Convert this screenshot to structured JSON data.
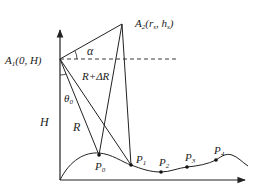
{
  "diagram": {
    "labels": {
      "A1": {
        "main": "A",
        "sub": "1",
        "rest": "(0, H)"
      },
      "A2": {
        "main": "A",
        "sub": "2",
        "rest_open": "(r",
        "rest_sub1": "s",
        "comma": ", h",
        "rest_sub2": "s",
        "close": ")"
      },
      "alpha": "α",
      "R_plus_dR": "R+ΔR",
      "theta0": {
        "main": "θ",
        "sub": "0"
      },
      "H": "H",
      "R": "R",
      "P0": {
        "main": "P",
        "sub": "0"
      },
      "P1": {
        "main": "P",
        "sub": "1"
      },
      "P2": {
        "main": "P",
        "sub": "2"
      },
      "P3": {
        "main": "P",
        "sub": "3"
      },
      "P4": {
        "main": "P",
        "sub": "4"
      }
    },
    "colors": {
      "line": "#222222",
      "background": "#ffffff"
    }
  }
}
